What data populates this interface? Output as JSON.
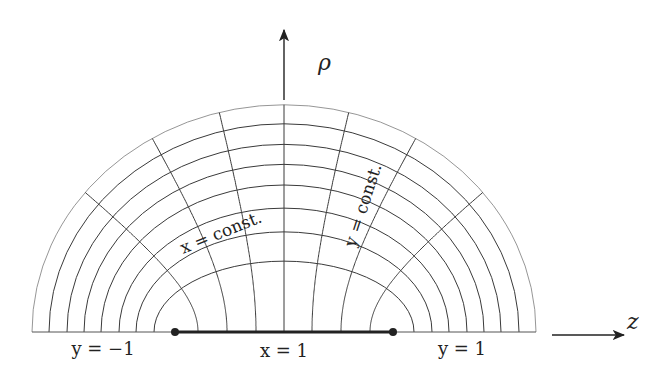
{
  "figure": {
    "type": "prolate-spheroidal-coordinate-grid",
    "width": 663,
    "height": 384,
    "background": "#ffffff",
    "line_color": "#3a3a3a",
    "outer_line_color": "#8a8a8a",
    "focal_segment_color": "#222222"
  },
  "geometry": {
    "center": [
      284,
      332
    ],
    "focal_half_distance": 109,
    "ellipse_semi_major_axes": [
      252,
      235,
      217,
      200,
      183,
      165,
      148,
      130
    ],
    "hyperbola_vertices": [
      -86,
      -57,
      -28,
      0,
      28,
      57,
      86
    ],
    "foci": [
      [
        175,
        332
      ],
      [
        393,
        332
      ]
    ]
  },
  "axes": {
    "rho": {
      "label": "ρ",
      "from": [
        284,
        100
      ],
      "to": [
        284,
        30
      ],
      "label_pos": [
        318,
        70
      ]
    },
    "z": {
      "label": "z",
      "from": [
        552,
        335
      ],
      "to": [
        624,
        335
      ],
      "label_pos": [
        627,
        329
      ]
    }
  },
  "labels": {
    "y_minus_1": "y = −1",
    "x_equals_1": "x = 1",
    "y_plus_1": "y = 1",
    "x_const": "x = const.",
    "y_const": "y = const."
  }
}
